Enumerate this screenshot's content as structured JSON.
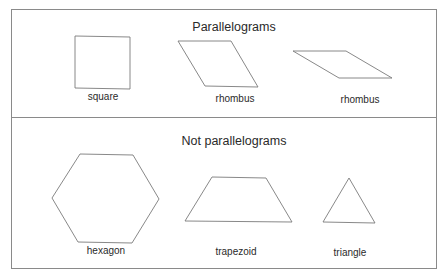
{
  "frame": {
    "x": 11,
    "y": 9,
    "width": 425,
    "height": 259,
    "divider_y": 117,
    "stroke_color": "#8a8a8a",
    "shape_stroke_color": "#7a7a7a"
  },
  "sections": [
    {
      "heading": "Parallelograms",
      "heading_pos": {
        "x": 234,
        "y": 21
      },
      "shapes": [
        {
          "name": "square",
          "label": "square",
          "points": "75,36 130,37 130,89 75,88",
          "label_pos": {
            "x": 103,
            "y": 92
          }
        },
        {
          "name": "rhombus-1",
          "label": "rhombus",
          "points": "178,41 231,41 258,87 205,86",
          "label_pos": {
            "x": 235,
            "y": 94
          }
        },
        {
          "name": "rhombus-2",
          "label": "rhombus",
          "points": "293,51 346,51 392,78 339,78",
          "label_pos": {
            "x": 360,
            "y": 95
          }
        }
      ]
    },
    {
      "heading": "Not parallelograms",
      "heading_pos": {
        "x": 234,
        "y": 135
      },
      "shapes": [
        {
          "name": "hexagon",
          "label": "hexagon",
          "points": "80,154 133,155 159,199 132,243 78,242 52,198",
          "label_pos": {
            "x": 106,
            "y": 246
          }
        },
        {
          "name": "trapezoid",
          "label": "trapezoid",
          "points": "212,177 266,178 292,222 185,221",
          "label_pos": {
            "x": 236,
            "y": 247
          }
        },
        {
          "name": "triangle",
          "label": "triangle",
          "points": "349,178 375,223 323,222",
          "label_pos": {
            "x": 350,
            "y": 248
          }
        }
      ]
    }
  ]
}
